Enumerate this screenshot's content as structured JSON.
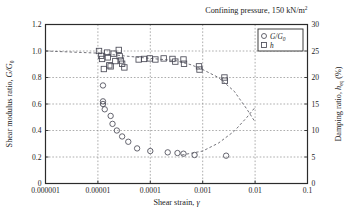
{
  "figure": {
    "title": "Confining pressure, 150 kN/m",
    "title_sup": "2",
    "width": 350,
    "height": 218
  },
  "axes": {
    "x": {
      "label_main": "Shear strain, ",
      "label_symbol": "γ",
      "ticks": [
        "0.000001",
        "0.00001",
        "0.0001",
        "0.001",
        "0.01",
        "0.1"
      ],
      "scale": "log",
      "min": 1e-06,
      "max": 0.1
    },
    "yleft": {
      "label_main": "Shear modulus ratio, ",
      "label_symbol": "G/G",
      "label_sub": "0",
      "ticks": [
        "0",
        "0.2",
        "0.4",
        "0.6",
        "0.8",
        "1.0",
        "1.2"
      ],
      "min": 0,
      "max": 1.2
    },
    "yright": {
      "label_main": "Damping ratio, ",
      "label_symbol": "h",
      "label_sub": "eq",
      "label_unit": " (%)",
      "ticks": [
        "0",
        "5",
        "10",
        "15",
        "20",
        "25",
        "30"
      ],
      "min": 0,
      "max": 30
    }
  },
  "legend": {
    "items": [
      {
        "marker": "circle",
        "label": "G/G",
        "label_sub": "0"
      },
      {
        "marker": "square",
        "label": "h",
        "label_sub": ""
      }
    ]
  },
  "colors": {
    "axis": "#2b2b2b",
    "grid": "#8a8a8a",
    "marker": "#4a4a56",
    "curve": "#5a5a62",
    "background": "#ffffff"
  },
  "chart_data": {
    "type": "scatter",
    "title": "Confining pressure, 150 kN/m2",
    "xlabel": "Shear strain, γ",
    "ylabel": "Shear modulus ratio, G/G0",
    "y2label": "Damping ratio, h_eq (%)",
    "xscale": "log",
    "xlim": [
      1e-06,
      0.1
    ],
    "ylim": [
      0,
      1.2
    ],
    "y2lim": [
      0,
      30
    ],
    "grid": true,
    "legend_position": "top-right",
    "series": [
      {
        "name": "G/G0",
        "marker": "circle",
        "axis": "left",
        "points": [
          {
            "x": 1.25e-05,
            "y": 0.74
          },
          {
            "x": 1.25e-05,
            "y": 0.62
          },
          {
            "x": 1.25e-05,
            "y": 0.6
          },
          {
            "x": 1.35e-05,
            "y": 0.56
          },
          {
            "x": 1.75e-05,
            "y": 0.51
          },
          {
            "x": 1.9e-05,
            "y": 0.45
          },
          {
            "x": 2.3e-05,
            "y": 0.4
          },
          {
            "x": 2.9e-05,
            "y": 0.355
          },
          {
            "x": 3.8e-05,
            "y": 0.315
          },
          {
            "x": 5.6e-05,
            "y": 0.265
          },
          {
            "x": 0.0001,
            "y": 0.245
          },
          {
            "x": 0.000215,
            "y": 0.235
          },
          {
            "x": 0.00033,
            "y": 0.23
          },
          {
            "x": 0.00043,
            "y": 0.225
          },
          {
            "x": 0.0007,
            "y": 0.215
          },
          {
            "x": 0.0028,
            "y": 0.21
          }
        ]
      },
      {
        "name": "h",
        "marker": "square",
        "axis": "right",
        "points": [
          {
            "x": 1.05e-05,
            "y": 25.0
          },
          {
            "x": 1.15e-05,
            "y": 24.1
          },
          {
            "x": 1.2e-05,
            "y": 23.5
          },
          {
            "x": 1.3e-05,
            "y": 21.6
          },
          {
            "x": 1.5e-05,
            "y": 24.7
          },
          {
            "x": 1.55e-05,
            "y": 23.8
          },
          {
            "x": 1.65e-05,
            "y": 22.3
          },
          {
            "x": 1.75e-05,
            "y": 22.1
          },
          {
            "x": 2e-05,
            "y": 24.5
          },
          {
            "x": 2.15e-05,
            "y": 23.1
          },
          {
            "x": 2.5e-05,
            "y": 25.2
          },
          {
            "x": 2.6e-05,
            "y": 24.0
          },
          {
            "x": 2.75e-05,
            "y": 23.2
          },
          {
            "x": 2.9e-05,
            "y": 22.6
          },
          {
            "x": 3.2e-05,
            "y": 21.9
          },
          {
            "x": 6e-05,
            "y": 23.4
          },
          {
            "x": 7.6e-05,
            "y": 23.5
          },
          {
            "x": 9.8e-05,
            "y": 23.6
          },
          {
            "x": 0.000125,
            "y": 23.4
          },
          {
            "x": 0.00018,
            "y": 23.6
          },
          {
            "x": 0.000265,
            "y": 23.5
          },
          {
            "x": 0.0003,
            "y": 23.0
          },
          {
            "x": 0.00043,
            "y": 23.4
          },
          {
            "x": 0.00044,
            "y": 22.6
          },
          {
            "x": 0.00085,
            "y": 22.1
          },
          {
            "x": 0.00087,
            "y": 21.5
          },
          {
            "x": 0.0026,
            "y": 20.0
          },
          {
            "x": 0.00265,
            "y": 19.4
          }
        ]
      }
    ],
    "curves": [
      {
        "name": "h-trend-descending",
        "style": "dashed",
        "axis": "right",
        "points": [
          {
            "x": 1e-06,
            "y": 25.0
          },
          {
            "x": 1e-05,
            "y": 24.6
          },
          {
            "x": 3e-05,
            "y": 24.1
          },
          {
            "x": 0.0001,
            "y": 23.6
          },
          {
            "x": 0.0003,
            "y": 23.2
          },
          {
            "x": 0.0006,
            "y": 22.4
          },
          {
            "x": 0.001,
            "y": 21.5
          },
          {
            "x": 0.002,
            "y": 20.0
          },
          {
            "x": 0.004,
            "y": 17.4
          },
          {
            "x": 0.007,
            "y": 14.0
          },
          {
            "x": 0.01,
            "y": 11.6
          }
        ]
      },
      {
        "name": "G-trend-ascending",
        "style": "dashed",
        "axis": "left",
        "points": [
          {
            "x": 0.0004,
            "y": 0.215
          },
          {
            "x": 0.001,
            "y": 0.245
          },
          {
            "x": 0.002,
            "y": 0.305
          },
          {
            "x": 0.004,
            "y": 0.395
          },
          {
            "x": 0.007,
            "y": 0.5
          },
          {
            "x": 0.01,
            "y": 0.575
          }
        ]
      }
    ]
  }
}
